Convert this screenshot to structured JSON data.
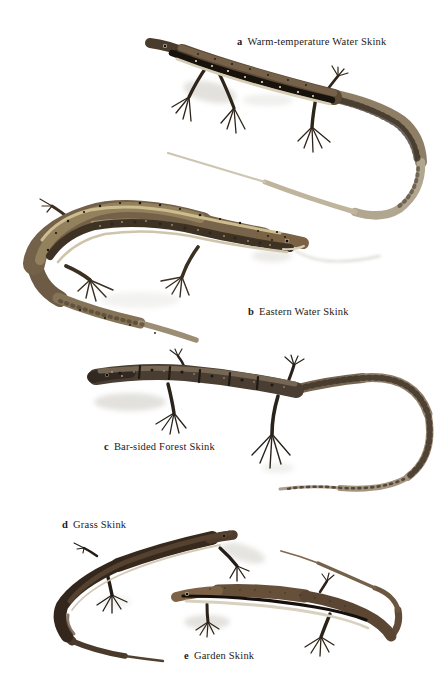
{
  "palette": {
    "background": "#ffffff",
    "caption_text": "#1d1a17",
    "shadow": "#c6c4bc"
  },
  "plate": {
    "figures": [
      {
        "key": "a",
        "name": "Warm-temperature Water Skink",
        "art": {
          "body": "#5d4a36",
          "lateral_band": "#18120c",
          "band_spots": "#ece3cb",
          "belly": "#d6cdb6",
          "tail_base": "#8d7e65",
          "tail_tip": "#cec6b2"
        }
      },
      {
        "key": "b",
        "name": "Eastern Water Skink",
        "art": {
          "body": "#74614a",
          "dorsolateral_stripe": "#cdbc90",
          "flank": "#3e3224",
          "spots": "#1c160f",
          "tail": "#9c8e74",
          "belly": "#cfc5ab"
        }
      },
      {
        "key": "c",
        "name": "Bar-sided Forest Skink",
        "art": {
          "body": "#4a3e33",
          "head": "#322a22",
          "bars": "#1f1913",
          "tail": "#a3947e",
          "tail_bars": "#42362a"
        }
      },
      {
        "key": "d",
        "name": "Grass Skink",
        "art": {
          "body": "#38291d",
          "head": "#4e3b2b",
          "flank_stripe": "#cfc3ad"
        }
      },
      {
        "key": "e",
        "name": "Garden Skink",
        "art": {
          "body": "#66503a",
          "head": "#7d6247",
          "lateral_stripe": "#15100b",
          "belly_stripe": "#d8d1bf"
        }
      }
    ]
  }
}
